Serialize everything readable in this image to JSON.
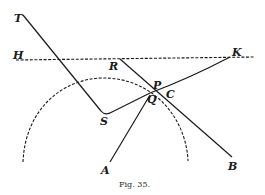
{
  "figure": {
    "caption": "Fig. 35.",
    "labels": {
      "T": "T",
      "H": "H",
      "R": "R",
      "K": "K",
      "P": "P",
      "C": "C",
      "Q": "Q",
      "S": "S",
      "A": "A",
      "B": "B"
    },
    "colors": {
      "ink": "#1a1a1a",
      "background": "#ffffff"
    }
  }
}
